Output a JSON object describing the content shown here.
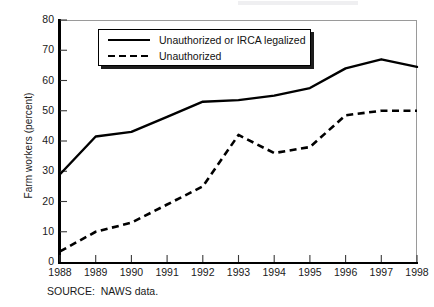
{
  "figure": {
    "source_note": "SOURCE:  NAWS data."
  },
  "chart_data": {
    "type": "line",
    "title": "",
    "xlabel": "",
    "ylabel": "Farm workers (percent)",
    "x": [
      1988,
      1989,
      1990,
      1991,
      1992,
      1993,
      1994,
      1995,
      1996,
      1997,
      1998
    ],
    "categories": [
      "1988",
      "1989",
      "1990",
      "1991",
      "1992",
      "1993",
      "1994",
      "1995",
      "1996",
      "1997",
      "1998"
    ],
    "xlim": [
      1988,
      1998
    ],
    "ylim": [
      0,
      80
    ],
    "ytick_labels": [
      "0",
      "10",
      "20",
      "30",
      "40",
      "50",
      "60",
      "70",
      "80"
    ],
    "yticks": [
      0,
      10,
      20,
      30,
      40,
      50,
      60,
      70,
      80
    ],
    "grid": false,
    "legend_position": "upper-left-inside",
    "series": [
      {
        "name": "Unauthorized or IRCA legalized",
        "style": "solid",
        "color": "#000000",
        "values": [
          29,
          41.5,
          43,
          48,
          53,
          53.5,
          55,
          57.5,
          64,
          67,
          64.5
        ]
      },
      {
        "name": "Unauthorized",
        "style": "dashed",
        "color": "#000000",
        "values": [
          3.5,
          10,
          13,
          19,
          25,
          42,
          36,
          38,
          48.5,
          50,
          50
        ]
      }
    ]
  }
}
